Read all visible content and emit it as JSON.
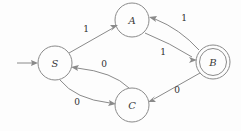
{
  "diagram": {
    "type": "finite-state-machine",
    "title": "",
    "width": 241,
    "height": 131,
    "background_color": "#fdfdfd",
    "stroke_color": "#8a8a8a",
    "text_color": "#2e2e2e",
    "states": [
      {
        "id": "S",
        "label": "S",
        "cx": 55,
        "cy": 63,
        "r": 17,
        "accepting": false,
        "start": true
      },
      {
        "id": "A",
        "label": "A",
        "cx": 132,
        "cy": 20,
        "r": 17,
        "accepting": false,
        "start": false
      },
      {
        "id": "B",
        "label": "B",
        "cx": 213,
        "cy": 62,
        "r": 17,
        "accepting": true,
        "start": false
      },
      {
        "id": "C",
        "label": "C",
        "cx": 132,
        "cy": 105,
        "r": 17,
        "accepting": false,
        "start": false
      }
    ],
    "start_arrow": {
      "from_x": 17,
      "to_x": 37,
      "y": 63
    },
    "transitions": [
      {
        "id": "S-A",
        "from": "S",
        "to": "A",
        "label": "1",
        "label_x": 86,
        "label_y": 29,
        "shape": "straight"
      },
      {
        "id": "A-B",
        "from": "A",
        "to": "B",
        "label": "1",
        "label_x": 163,
        "label_y": 52,
        "shape": "curve"
      },
      {
        "id": "B-A",
        "from": "B",
        "to": "A",
        "label": "1",
        "label_x": 184,
        "label_y": 18,
        "shape": "curve"
      },
      {
        "id": "B-C",
        "from": "B",
        "to": "C",
        "label": "0",
        "label_x": 177,
        "label_y": 90,
        "shape": "straight"
      },
      {
        "id": "C-S",
        "from": "C",
        "to": "S",
        "label": "0",
        "label_x": 104,
        "label_y": 64,
        "shape": "curve"
      },
      {
        "id": "S-C",
        "from": "S",
        "to": "C",
        "label": "0",
        "label_x": 77,
        "label_y": 102,
        "shape": "curve"
      }
    ]
  }
}
